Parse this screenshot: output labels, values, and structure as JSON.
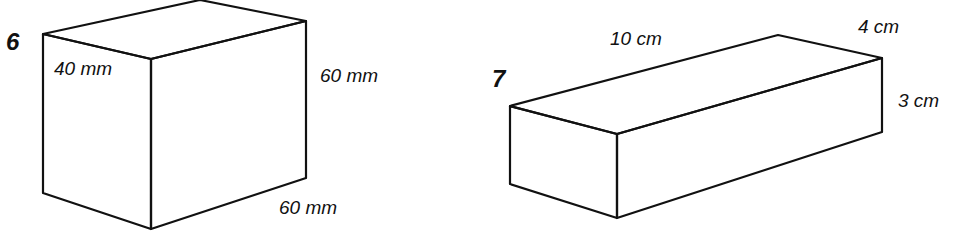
{
  "figures": [
    {
      "number": "6",
      "shape": "cuboid",
      "labels": {
        "depth": "40 mm",
        "height": "60 mm",
        "length": "60 mm"
      }
    },
    {
      "number": "7",
      "shape": "cuboid",
      "labels": {
        "length": "10 cm",
        "depth": "4 cm",
        "height": "3 cm"
      }
    }
  ]
}
